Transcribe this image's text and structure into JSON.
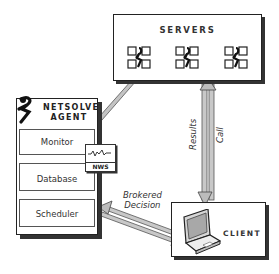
{
  "diagram": {
    "servers": {
      "title": "SERVERS",
      "server_count": 3
    },
    "agent": {
      "title_line1": "NETSOLVE",
      "title_line2": "AGENT",
      "modules": [
        {
          "label": "Monitor"
        },
        {
          "label": "Database"
        },
        {
          "label": "Scheduler"
        }
      ],
      "nws_label": "NWS"
    },
    "client": {
      "title": "CLIENT"
    },
    "edges": {
      "brokered_line1": "Brokered",
      "brokered_line2": "Decision",
      "results": "Results",
      "call": "Call"
    },
    "colors": {
      "arrow_fill": "#b0b0b0",
      "stroke": "#222222"
    }
  }
}
